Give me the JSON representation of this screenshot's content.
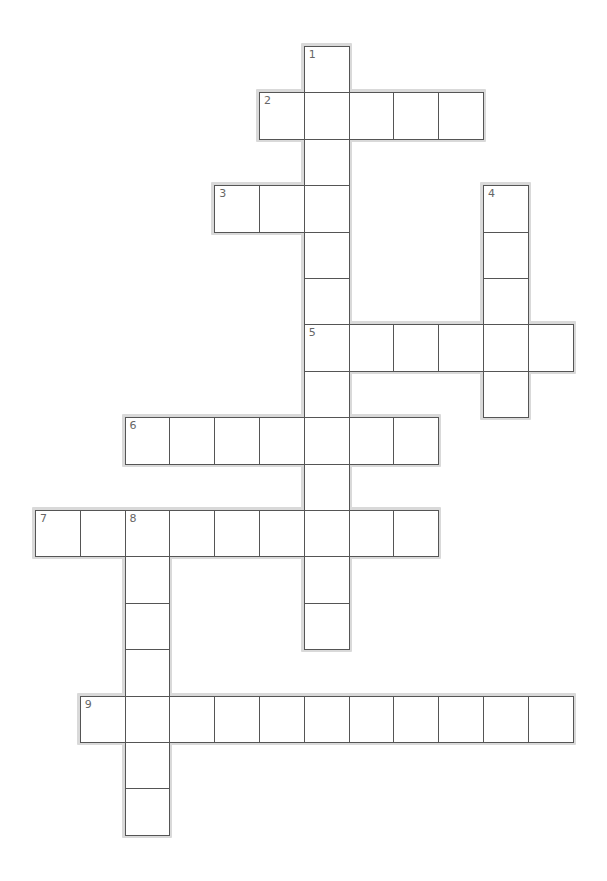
{
  "puzzle": {
    "grid_origin": {
      "x": 35,
      "y": 46
    },
    "cell_width": 44.8,
    "cell_height": 46.4,
    "colors": {
      "cell_bg": "#ffffff",
      "cell_border": "#555555",
      "halo": "#d9d9d9",
      "number": "#666666"
    },
    "words": [
      {
        "number": "1",
        "direction": "down",
        "row": 0,
        "col": 6,
        "length": 13
      },
      {
        "number": "2",
        "direction": "across",
        "row": 1,
        "col": 5,
        "length": 5
      },
      {
        "number": "3",
        "direction": "across",
        "row": 3,
        "col": 4,
        "length": 3
      },
      {
        "number": "4",
        "direction": "down",
        "row": 3,
        "col": 10,
        "length": 5
      },
      {
        "number": "5",
        "direction": "across",
        "row": 6,
        "col": 6,
        "length": 6
      },
      {
        "number": "6",
        "direction": "across",
        "row": 8,
        "col": 2,
        "length": 7
      },
      {
        "number": "7",
        "direction": "across",
        "row": 10,
        "col": 0,
        "length": 9
      },
      {
        "number": "8",
        "direction": "down",
        "row": 10,
        "col": 2,
        "length": 7
      },
      {
        "number": "9",
        "direction": "across",
        "row": 14,
        "col": 1,
        "length": 11
      }
    ]
  }
}
